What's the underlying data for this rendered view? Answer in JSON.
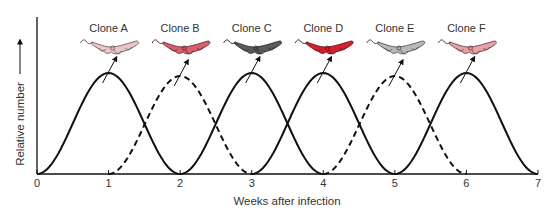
{
  "chart_data": {
    "type": "line",
    "title": "",
    "xlabel": "Weeks after infection",
    "ylabel": "Relative number",
    "xlim": [
      0,
      7
    ],
    "ylim": [
      0,
      1
    ],
    "x_ticks": [
      "0",
      "1",
      "2",
      "3",
      "4",
      "5",
      "6",
      "7"
    ],
    "y_ticks": [],
    "grid": false,
    "legend": "none",
    "y_axis_arrow": true,
    "series": [
      {
        "name": "Clone A",
        "style": "solid",
        "peak_week": 1,
        "start_week": 0,
        "end_week": 2,
        "peak_value": 1.0,
        "icon_color": "#e9c6c8",
        "icon_outline": "#6b4a4c"
      },
      {
        "name": "Clone B",
        "style": "dashed",
        "peak_week": 2,
        "start_week": 1,
        "end_week": 3,
        "peak_value": 0.97,
        "icon_color": "#d95f6a",
        "icon_outline": "#5a2228"
      },
      {
        "name": "Clone C",
        "style": "solid",
        "peak_week": 3,
        "start_week": 2,
        "end_week": 4,
        "peak_value": 1.0,
        "icon_color": "#5a5a5a",
        "icon_outline": "#222222"
      },
      {
        "name": "Clone D",
        "style": "solid",
        "peak_week": 4,
        "start_week": 3,
        "end_week": 5,
        "peak_value": 1.0,
        "icon_color": "#d4202e",
        "icon_outline": "#5a0e14"
      },
      {
        "name": "Clone E",
        "style": "dashed",
        "peak_week": 5,
        "start_week": 4,
        "end_week": 6,
        "peak_value": 0.97,
        "icon_color": "#b8b8b8",
        "icon_outline": "#444444"
      },
      {
        "name": "Clone F",
        "style": "solid",
        "peak_week": 6,
        "start_week": 5,
        "end_week": 7,
        "peak_value": 1.0,
        "icon_color": "#e6a2a6",
        "icon_outline": "#5a3236"
      }
    ],
    "annotations": [
      "Each peak has an arrow pointing to a trypanosome icon labelled with its clone name"
    ]
  },
  "labels": {
    "xlabel": "Weeks after infection",
    "ylabel": "Relative number",
    "ticks": [
      "0",
      "1",
      "2",
      "3",
      "4",
      "5",
      "6",
      "7"
    ],
    "clones": [
      "Clone A",
      "Clone B",
      "Clone C",
      "Clone D",
      "Clone E",
      "Clone F"
    ]
  }
}
